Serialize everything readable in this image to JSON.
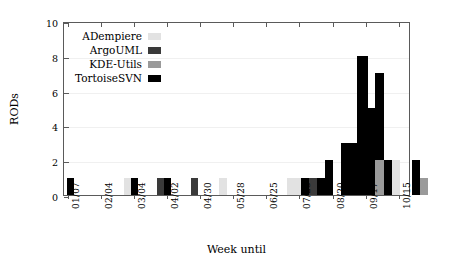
{
  "chart_data": {
    "type": "bar",
    "title": "",
    "xlabel": "Week until",
    "ylabel": "RODs",
    "ylim": [
      0,
      10
    ],
    "yticks": [
      0,
      2,
      4,
      6,
      8,
      10
    ],
    "grid": true,
    "legend_position": "top-left",
    "stacked": false,
    "note": "Grouped bars per week; each week slot can hold bars from several projects side by side.",
    "categories": [
      "01/07",
      "01/14",
      "01/21",
      "01/28",
      "02/04",
      "02/11",
      "02/18",
      "02/25",
      "03/04",
      "03/11",
      "03/18",
      "03/25",
      "04/02",
      "04/09",
      "04/16",
      "04/23",
      "04/30",
      "05/07",
      "05/14",
      "05/21",
      "05/28",
      "06/04",
      "06/11",
      "06/18",
      "06/25",
      "07/02",
      "07/09",
      "07/16",
      "07/23",
      "07/30",
      "08/06",
      "08/13",
      "08/20",
      "08/27",
      "09/03",
      "09/10",
      "09/17",
      "09/24",
      "10/01",
      "10/08",
      "10/15",
      "10/22"
    ],
    "xtick_labels": [
      "01/07",
      "02/04",
      "03/04",
      "04/02",
      "04/30",
      "05/28",
      "06/25",
      "07/23",
      "08/20",
      "09/17",
      "10/15"
    ],
    "series": [
      {
        "name": "ADempiere",
        "color": "#e2e2e2",
        "values": [
          0,
          0,
          0,
          0,
          0,
          0,
          0,
          0,
          1,
          0,
          0,
          0,
          0,
          0,
          0,
          0,
          0,
          0,
          1,
          0,
          0,
          0,
          0,
          0,
          1,
          1,
          0,
          0,
          0,
          0,
          0,
          0,
          0,
          0,
          0,
          0,
          2,
          0,
          0,
          0,
          0,
          0
        ]
      },
      {
        "name": "ArgoUML",
        "color": "#3a3a3a",
        "values": [
          0,
          0,
          0,
          0,
          0,
          0,
          0,
          0,
          0,
          0,
          0,
          0,
          1,
          0,
          0,
          0,
          1,
          0,
          0,
          0,
          0,
          0,
          0,
          0,
          0,
          0,
          0,
          0,
          1,
          0,
          0,
          0,
          0,
          0,
          0,
          0,
          0,
          0,
          0,
          0,
          0,
          0
        ]
      },
      {
        "name": "KDE-Utils",
        "color": "#9a9a9a",
        "values": [
          0,
          0,
          0,
          0,
          0,
          0,
          0,
          0,
          0,
          0,
          0,
          0,
          0,
          0,
          0,
          0,
          0,
          0,
          0,
          0,
          0,
          0,
          0,
          0,
          0,
          0,
          0,
          0,
          0,
          0,
          0,
          0,
          0,
          0,
          0,
          2,
          0,
          0,
          0,
          1,
          0,
          0
        ]
      },
      {
        "name": "TortoiseSVN",
        "color": "#000000",
        "values": [
          1,
          0,
          0,
          0,
          0,
          0,
          0,
          0,
          1,
          0,
          0,
          0,
          1,
          0,
          0,
          0,
          0,
          0,
          0,
          0,
          0,
          0,
          0,
          0,
          0,
          1,
          0,
          0,
          1,
          2,
          3,
          8,
          5,
          7,
          2,
          0,
          0,
          0,
          0,
          0,
          2,
          0
        ]
      }
    ],
    "bars": [
      {
        "week": "01/07",
        "series": "TortoiseSVN",
        "value": 1,
        "x": 66,
        "w": 7
      },
      {
        "week": "03/04",
        "series": "ADempiere",
        "value": 1,
        "x": 123,
        "w": 7
      },
      {
        "week": "03/04",
        "series": "TortoiseSVN",
        "value": 1,
        "x": 130,
        "w": 7
      },
      {
        "week": "04/02",
        "series": "ArgoUML",
        "value": 1,
        "x": 156,
        "w": 7
      },
      {
        "week": "04/02",
        "series": "TortoiseSVN",
        "value": 1,
        "x": 163,
        "w": 7
      },
      {
        "week": "04/30",
        "series": "ArgoUML",
        "value": 1,
        "x": 190,
        "w": 7
      },
      {
        "week": "05/14",
        "series": "ADempiere",
        "value": 1,
        "x": 218,
        "w": 8
      },
      {
        "week": "06/25",
        "series": "ADempiere",
        "value": 1,
        "x": 286,
        "w": 7
      },
      {
        "week": "07/02",
        "series": "ADempiere",
        "value": 1,
        "x": 293,
        "w": 7
      },
      {
        "week": "07/16",
        "series": "TortoiseSVN",
        "value": 1,
        "x": 300,
        "w": 8
      },
      {
        "week": "07/23",
        "series": "ArgoUML",
        "value": 1,
        "x": 308,
        "w": 8
      },
      {
        "week": "07/23",
        "series": "TortoiseSVN",
        "value": 1,
        "x": 316,
        "w": 8
      },
      {
        "week": "07/30",
        "series": "TortoiseSVN",
        "value": 2,
        "x": 324,
        "w": 8
      },
      {
        "week": "08/06",
        "series": "TortoiseSVN",
        "value": 3,
        "x": 340,
        "w": 16
      },
      {
        "week": "08/20",
        "series": "TortoiseSVN",
        "value": 8,
        "x": 356,
        "w": 11
      },
      {
        "week": "08/27",
        "series": "TortoiseSVN",
        "value": 5,
        "x": 367,
        "w": 7
      },
      {
        "week": "09/03",
        "series": "TortoiseSVN",
        "value": 7,
        "x": 374,
        "w": 9
      },
      {
        "week": "09/10",
        "series": "TortoiseSVN",
        "value": 2,
        "x": 383,
        "w": 8
      },
      {
        "week": "09/10",
        "series": "KDE-Utils",
        "value": 2,
        "x": 374,
        "w": 9
      },
      {
        "week": "09/17",
        "series": "ADempiere",
        "value": 2,
        "x": 391,
        "w": 8
      },
      {
        "week": "10/15",
        "series": "TortoiseSVN",
        "value": 2,
        "x": 411,
        "w": 8
      },
      {
        "week": "10/22",
        "series": "KDE-Utils",
        "value": 1,
        "x": 419,
        "w": 8
      }
    ],
    "legend": [
      {
        "label": "ADempiere",
        "color": "#e2e2e2"
      },
      {
        "label": "ArgoUML",
        "color": "#3a3a3a"
      },
      {
        "label": "KDE-Utils",
        "color": "#9a9a9a"
      },
      {
        "label": "TortoiseSVN",
        "color": "#000000"
      }
    ]
  }
}
